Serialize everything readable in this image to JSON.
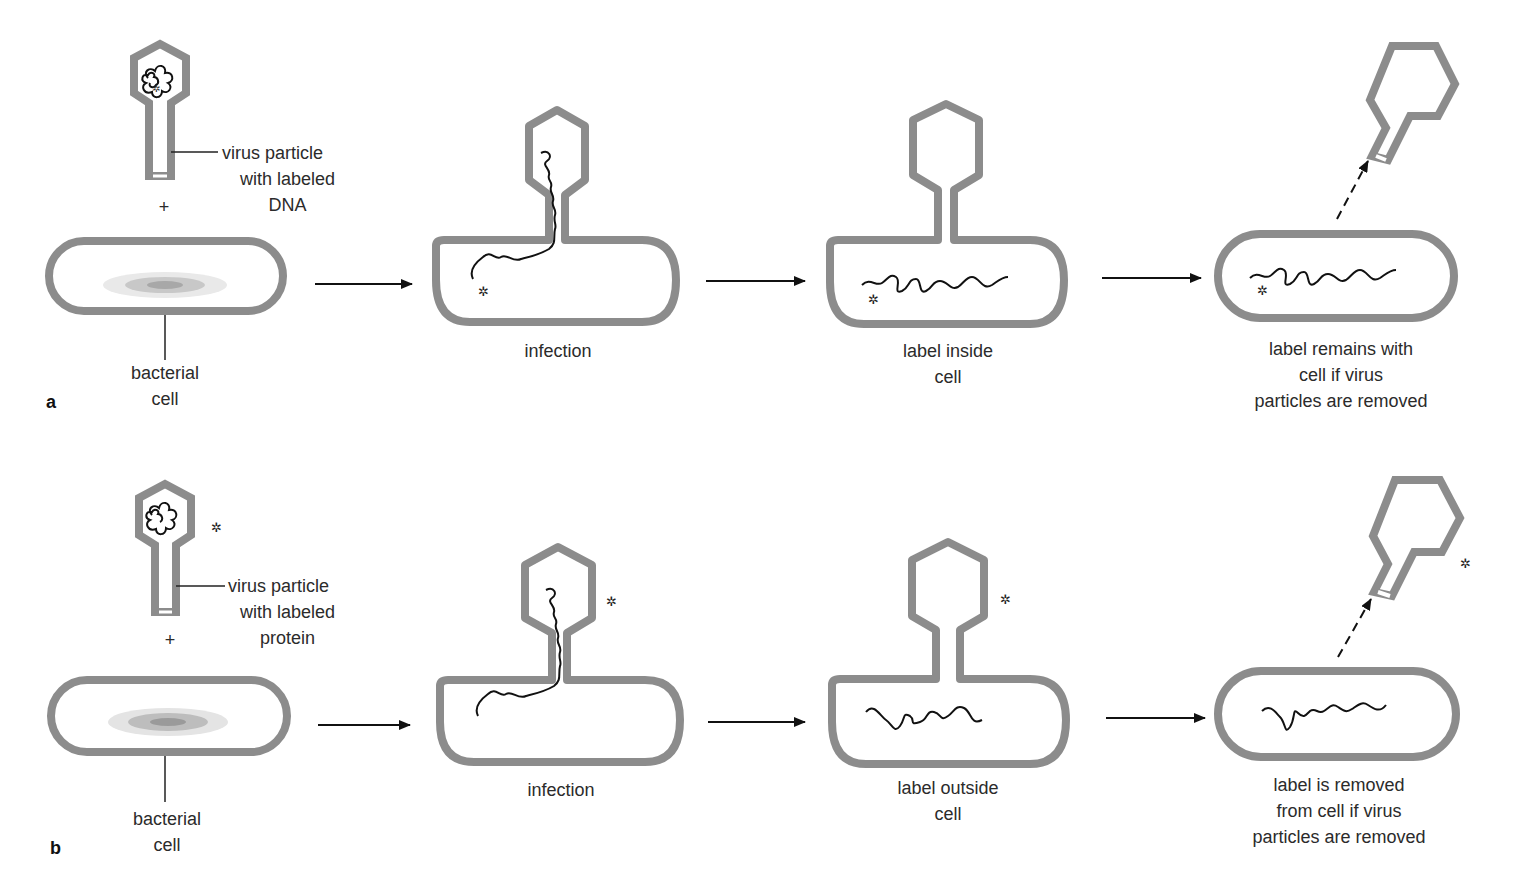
{
  "colors": {
    "wall": "#8c8c8c",
    "dna": "#111111",
    "text": "#2b2b2b",
    "background": "#ffffff"
  },
  "label_marker": "✲",
  "panels": [
    {
      "letter": "a",
      "start": {
        "virus_label": [
          "virus particle",
          "with labeled",
          "DNA"
        ],
        "plus": "+",
        "cell_label": [
          "bacterial",
          "cell"
        ]
      },
      "steps": [
        {
          "caption": [
            "infection"
          ],
          "label_location": "inside cell with DNA"
        },
        {
          "caption": [
            "label inside",
            "cell"
          ],
          "label_location": "inside cell"
        },
        {
          "caption": [
            "label remains with",
            "cell if virus",
            "particles are removed"
          ],
          "label_location": "inside cell"
        }
      ]
    },
    {
      "letter": "b",
      "start": {
        "virus_label": [
          "virus particle",
          "with labeled",
          "protein"
        ],
        "plus": "+",
        "cell_label": [
          "bacterial",
          "cell"
        ]
      },
      "steps": [
        {
          "caption": [
            "infection"
          ],
          "label_location": "outside, on virus coat"
        },
        {
          "caption": [
            "label outside",
            "cell"
          ],
          "label_location": "outside, on virus coat"
        },
        {
          "caption": [
            "label is removed",
            "from cell if virus",
            "particles are removed"
          ],
          "label_location": "removed with virus coat"
        }
      ]
    }
  ]
}
